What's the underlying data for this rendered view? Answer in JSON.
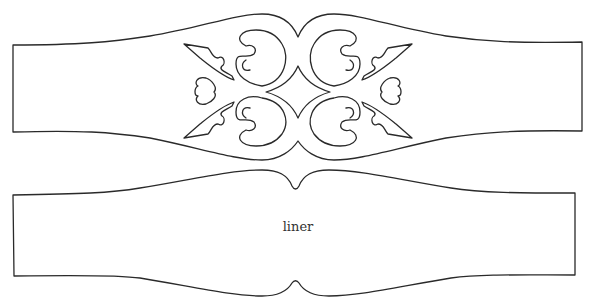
{
  "diagram": {
    "type": "cutting-template",
    "pieces": [
      {
        "name": "decorative band",
        "label": "",
        "has_cutout_ornament": true
      },
      {
        "name": "liner",
        "label": "liner",
        "has_cutout_ornament": false
      }
    ],
    "colors": {
      "line": "#2a2a2a",
      "background": "#ffffff"
    }
  },
  "labels": {
    "liner": "liner"
  }
}
